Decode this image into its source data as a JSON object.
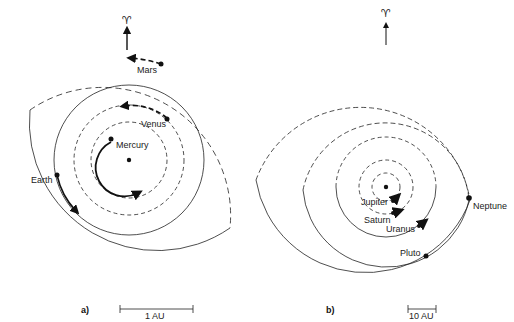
{
  "figure": {
    "panel_a": {
      "label": "a)",
      "equinox_symbol": "♈",
      "scale_bar": "1 AU",
      "planets": [
        {
          "name": "Mercury"
        },
        {
          "name": "Venus"
        },
        {
          "name": "Earth"
        },
        {
          "name": "Mars"
        }
      ]
    },
    "panel_b": {
      "label": "b)",
      "equinox_symbol": "♈",
      "scale_bar": "10 AU",
      "planets": [
        {
          "name": "Jupiter"
        },
        {
          "name": "Saturn"
        },
        {
          "name": "Uranus"
        },
        {
          "name": "Neptune"
        },
        {
          "name": "Pluto"
        }
      ]
    },
    "colors": {
      "ink": "#222222",
      "background": "#ffffff"
    }
  }
}
